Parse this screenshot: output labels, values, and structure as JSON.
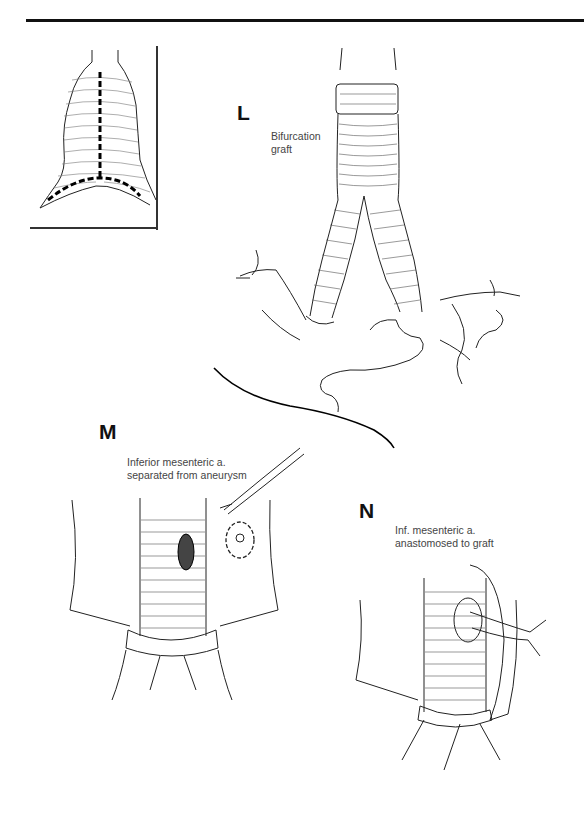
{
  "page": {
    "figure_type": "surgical illustration",
    "inset": {
      "description": "aneurysm sac with dashed incision lines"
    },
    "panels": [
      {
        "letter": "L",
        "caption_lines": [
          "Bifurcation",
          "graft"
        ]
      },
      {
        "letter": "M",
        "caption_lines": [
          "Inferior mesenteric a.",
          "separated from aneurysm"
        ]
      },
      {
        "letter": "N",
        "caption_lines": [
          "Inf. mesenteric a.",
          "anastomosed to graft"
        ]
      }
    ]
  },
  "colors": {
    "ink": "#111111",
    "caption": "#444444",
    "background": "#ffffff"
  }
}
